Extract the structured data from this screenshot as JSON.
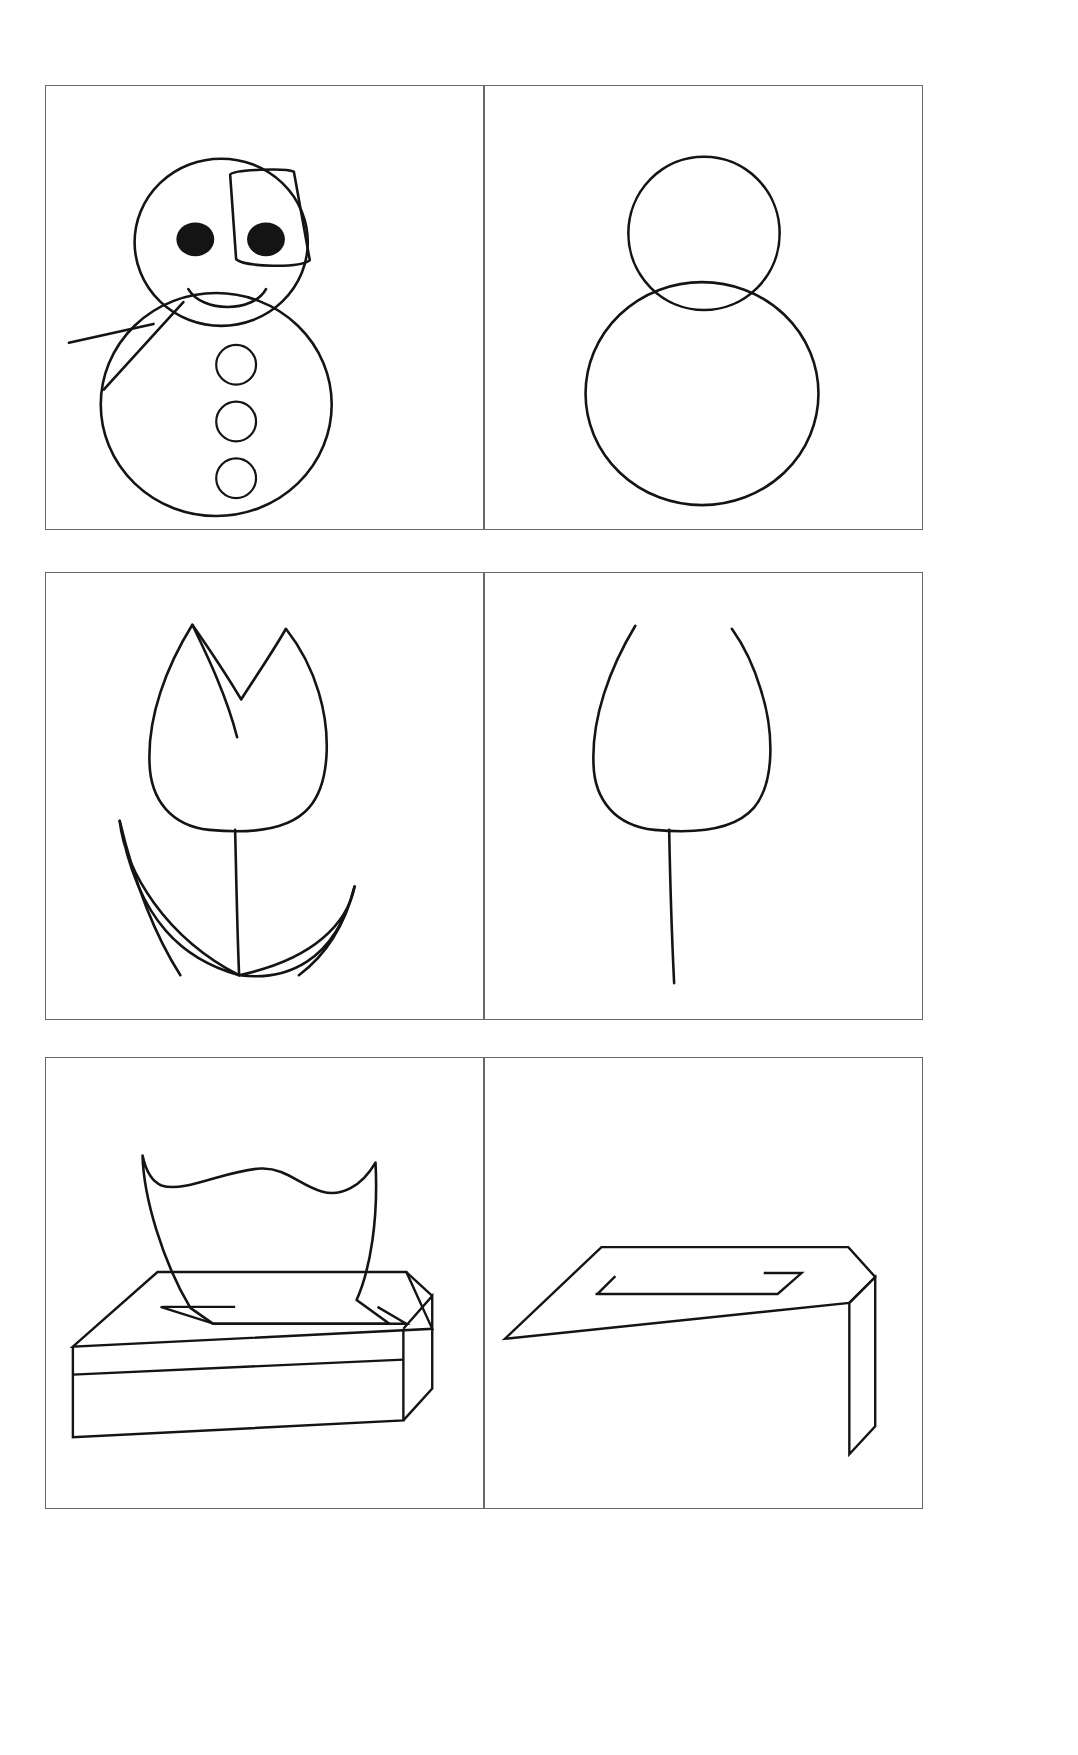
{
  "page": {
    "background_color": "#ffffff",
    "ink_color": "#141414",
    "frame_color": "#6a6a6a",
    "width": 1078,
    "height": 1755
  },
  "rows": [
    {
      "row_name": "snowman-row",
      "panels": [
        {
          "panel_name": "snowman-complete",
          "subject": "snowman",
          "stage": "complete",
          "elements": [
            "hat",
            "head-circle",
            "left-eye",
            "right-eye",
            "smile",
            "body-circle",
            "stick-arm",
            "button-top",
            "button-middle",
            "button-bottom"
          ]
        },
        {
          "panel_name": "snowman-outline",
          "subject": "snowman",
          "stage": "outline",
          "elements": [
            "head-circle",
            "body-circle"
          ]
        }
      ]
    },
    {
      "row_name": "tulip-row",
      "panels": [
        {
          "panel_name": "tulip-complete",
          "subject": "tulip",
          "stage": "complete",
          "elements": [
            "bloom",
            "inner-petal-line",
            "stem",
            "left-leaf",
            "right-leaf"
          ]
        },
        {
          "panel_name": "tulip-outline",
          "subject": "tulip",
          "stage": "outline",
          "elements": [
            "bloom",
            "stem"
          ]
        }
      ]
    },
    {
      "row_name": "tissue-box-row",
      "panels": [
        {
          "panel_name": "tissue-box-complete",
          "subject": "tissue box",
          "stage": "complete",
          "elements": [
            "tissue-sheet",
            "box-top-face",
            "box-front-face",
            "box-side-face",
            "box-slot",
            "band-line"
          ]
        },
        {
          "panel_name": "tissue-box-outline",
          "subject": "tissue box",
          "stage": "outline",
          "elements": [
            "box-top-face",
            "box-side-face",
            "box-slot"
          ]
        }
      ]
    }
  ]
}
